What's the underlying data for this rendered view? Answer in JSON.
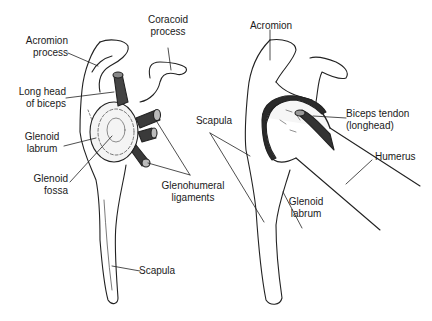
{
  "diagram": {
    "type": "anatomical-illustration",
    "left_view": {
      "labels": [
        {
          "id": "acromion-process",
          "lines": [
            "Acromion",
            "process"
          ]
        },
        {
          "id": "coracoid-process",
          "lines": [
            "Coracoid",
            "process"
          ]
        },
        {
          "id": "long-head-of-biceps",
          "lines": [
            "Long head",
            "of biceps"
          ]
        },
        {
          "id": "glenoid-labrum",
          "lines": [
            "Glenoid",
            "labrum"
          ]
        },
        {
          "id": "glenoid-fossa",
          "lines": [
            "Glenoid",
            "fossa"
          ]
        },
        {
          "id": "glenohumeral-ligaments",
          "lines": [
            "Glenohumeral",
            "ligaments"
          ]
        },
        {
          "id": "scapula",
          "lines": [
            "Scapula"
          ]
        }
      ]
    },
    "right_view": {
      "labels": [
        {
          "id": "acromion",
          "lines": [
            "Acromion"
          ]
        },
        {
          "id": "scapula",
          "lines": [
            "Scapula"
          ]
        },
        {
          "id": "biceps-tendon",
          "lines": [
            "Biceps tendon",
            "(longhead)"
          ]
        },
        {
          "id": "humerus",
          "lines": [
            "Humerus"
          ]
        },
        {
          "id": "glenoid-labrum",
          "lines": [
            "Glenoid",
            "labrum"
          ]
        }
      ]
    }
  }
}
